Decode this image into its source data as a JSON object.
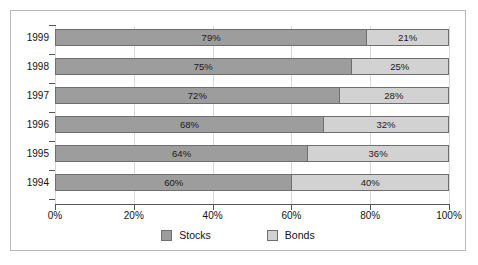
{
  "chart_data": {
    "type": "bar",
    "orientation": "horizontal",
    "stacked": true,
    "title": "",
    "subtitle": "",
    "xlabel": "",
    "ylabel": "",
    "categories": [
      "1994",
      "1995",
      "1996",
      "1997",
      "1998",
      "1999"
    ],
    "categories_display_order": [
      "1999",
      "1998",
      "1997",
      "1996",
      "1995",
      "1994"
    ],
    "series": [
      {
        "name": "Stocks",
        "color": "#9d9d9d",
        "values": [
          60,
          64,
          68,
          72,
          75,
          79
        ],
        "labels": [
          "60%",
          "64%",
          "68%",
          "72%",
          "75%",
          "79%"
        ]
      },
      {
        "name": "Bonds",
        "color": "#d2d2d2",
        "values": [
          40,
          36,
          32,
          28,
          25,
          21
        ],
        "labels": [
          "40%",
          "36%",
          "32%",
          "28%",
          "25%",
          "21%"
        ]
      }
    ],
    "rows": [
      {
        "year": "1999",
        "stocks": 79,
        "bonds": 21,
        "stocks_label": "79%",
        "bonds_label": "21%"
      },
      {
        "year": "1998",
        "stocks": 75,
        "bonds": 25,
        "stocks_label": "75%",
        "bonds_label": "25%"
      },
      {
        "year": "1997",
        "stocks": 72,
        "bonds": 28,
        "stocks_label": "72%",
        "bonds_label": "28%"
      },
      {
        "year": "1996",
        "stocks": 68,
        "bonds": 32,
        "stocks_label": "68%",
        "bonds_label": "32%"
      },
      {
        "year": "1995",
        "stocks": 64,
        "bonds": 36,
        "stocks_label": "64%",
        "bonds_label": "36%"
      },
      {
        "year": "1994",
        "stocks": 60,
        "bonds": 40,
        "stocks_label": "60%",
        "bonds_label": "40%"
      }
    ],
    "xlim": [
      0,
      100
    ],
    "xticks": [
      0,
      20,
      40,
      60,
      80,
      100
    ],
    "xtick_labels": [
      "0%",
      "20%",
      "40%",
      "60%",
      "80%",
      "100%"
    ],
    "grid": true,
    "legend_position": "bottom",
    "legend": [
      {
        "label": "Stocks",
        "color": "#9d9d9d"
      },
      {
        "label": "Bonds",
        "color": "#d2d2d2"
      }
    ]
  },
  "frame": {
    "border_color": "#b9b9b9",
    "background": "#ffffff"
  },
  "axis": {
    "line_color": "#555555",
    "grid_color": "#d8d8d8"
  }
}
